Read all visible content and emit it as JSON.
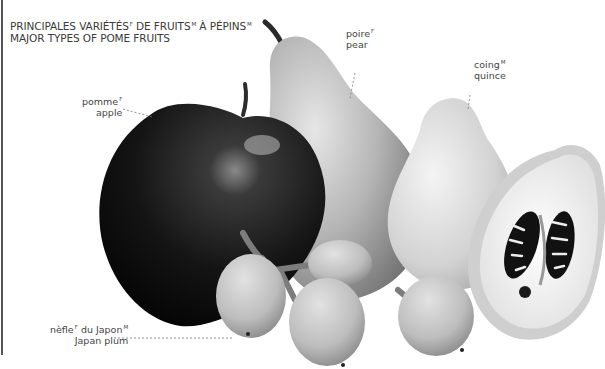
{
  "title": {
    "fr_parts": [
      {
        "text": "PRINCIPALES VARIÉTÉS",
        "gender": "f"
      },
      {
        "text": " DE FRUITS",
        "gender": "M"
      },
      {
        "text": " À PÉPINS",
        "gender": "M"
      }
    ],
    "line1_a": "PRINCIPALES VARIÉTÉS",
    "line1_a_sup": "F",
    "line1_b": " DE FRUITS",
    "line1_b_sup": "M",
    "line1_c": " À PÉPINS",
    "line1_c_sup": "M",
    "line2": "MAJOR TYPES OF POME FRUITS"
  },
  "labels": {
    "apple": {
      "fr": "pomme",
      "gender": "F",
      "en": "apple"
    },
    "pear": {
      "fr": "poire",
      "gender": "F",
      "en": "pear"
    },
    "quince": {
      "fr": "coing",
      "gender": "M",
      "en": "quince"
    },
    "loquat": {
      "fr": "nèfle",
      "gender": "F",
      "fr_suffix": " du Japon",
      "suffix_gender": "M",
      "en": "Japan plum"
    }
  },
  "colors": {
    "apple": "#1a1a1a",
    "pear": "#b8b8b8",
    "quince": "#d6d6d6",
    "loquat": "#c4c4c4",
    "seeds": "#111111",
    "leader_line": "#777777"
  }
}
